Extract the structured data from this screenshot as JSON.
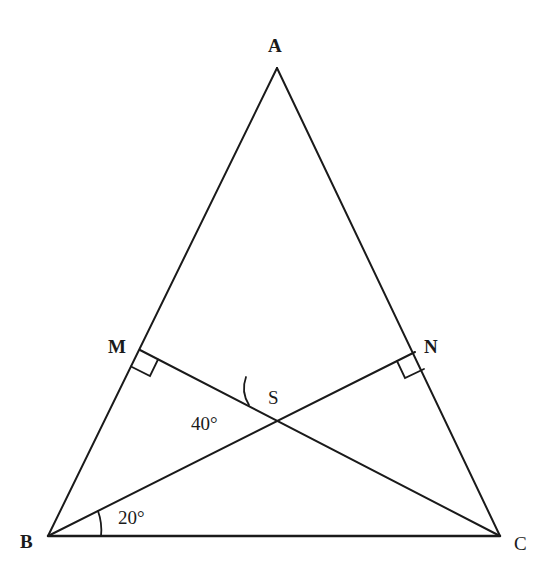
{
  "diagram": {
    "type": "geometry-triangle",
    "points": {
      "A": {
        "label": "A",
        "x": 277,
        "y": 68
      },
      "B": {
        "label": "B",
        "x": 48,
        "y": 536
      },
      "C": {
        "label": "C",
        "x": 500,
        "y": 536
      },
      "M": {
        "label": "M",
        "x": 140,
        "y": 350
      },
      "N": {
        "label": "N",
        "x": 415,
        "y": 352
      },
      "S": {
        "label": "S",
        "x": 275,
        "y": 392
      }
    },
    "segments": [
      "AB",
      "AC",
      "BC",
      "BN",
      "CM"
    ],
    "right_angles": [
      "M",
      "N"
    ],
    "angles": {
      "angle_S": {
        "label": "40°",
        "vertex": "S"
      },
      "angle_B": {
        "label": "20°",
        "vertex": "B"
      }
    },
    "colors": {
      "stroke": "#1a1a1a",
      "background": "#ffffff"
    }
  }
}
